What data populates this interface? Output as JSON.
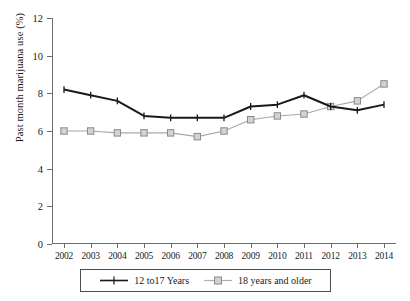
{
  "chart_data": {
    "type": "line",
    "title": "",
    "xlabel": "",
    "ylabel": "Past month marijuana use (%)",
    "categories": [
      "2002",
      "2003",
      "2004",
      "2005",
      "2006",
      "2007",
      "2008",
      "2009",
      "2010",
      "2011",
      "2012",
      "2013",
      "2014"
    ],
    "ylim": [
      0,
      12
    ],
    "yticks": [
      0,
      2,
      4,
      6,
      8,
      10,
      12
    ],
    "ytick_labels": [
      "0",
      "2",
      "4",
      "6",
      "8",
      "10",
      "12"
    ],
    "grid": false,
    "legend_position": "bottom",
    "series": [
      {
        "name": "12 to17 Years",
        "color": "#1a1a1a",
        "marker": "plus",
        "values": [
          8.2,
          7.9,
          7.6,
          6.8,
          6.7,
          6.7,
          6.7,
          7.3,
          7.4,
          7.9,
          7.3,
          7.1,
          7.4
        ]
      },
      {
        "name": "18 years and older",
        "color": "#a8a8a8",
        "marker": "square",
        "values": [
          6.0,
          6.0,
          5.9,
          5.9,
          5.9,
          5.7,
          6.0,
          6.6,
          6.8,
          6.9,
          7.3,
          7.6,
          8.5
        ]
      }
    ]
  },
  "legend": {
    "items": [
      {
        "label": "12 to17 Years"
      },
      {
        "label": "18 years and older"
      }
    ]
  }
}
